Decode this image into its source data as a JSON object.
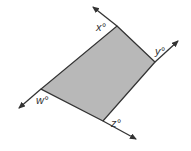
{
  "diagram": {
    "type": "parallelogram-with-extended-sides",
    "fill_color": "#b8b8b8",
    "line_color": "#333333",
    "vertices": {
      "top": [
        117,
        26
      ],
      "right": [
        155,
        62
      ],
      "bottom": [
        103,
        121
      ],
      "left": [
        41,
        89
      ]
    },
    "angle_labels": {
      "x": "x°",
      "y": "y°",
      "z": "z°",
      "w": "w°"
    }
  }
}
